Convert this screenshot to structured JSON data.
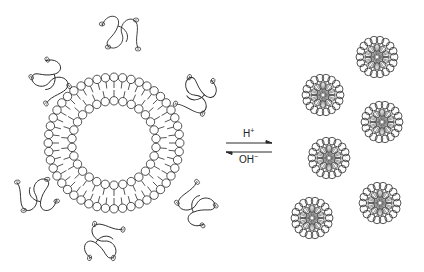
{
  "diagram": {
    "type": "vesicle-to-micelle transition",
    "left": {
      "label": "vesicle (lipid bilayer) with surrounding polymer chains",
      "vesicle": {
        "cx": 114,
        "cy": 143,
        "outer_r": 70,
        "inner_r": 38,
        "outer_heads": 48,
        "inner_heads": 30
      },
      "polymers": [
        {
          "x": 120,
          "y": 30
        },
        {
          "x": 52,
          "y": 78
        },
        {
          "x": 200,
          "y": 95
        },
        {
          "x": 38,
          "y": 198
        },
        {
          "x": 195,
          "y": 208
        },
        {
          "x": 100,
          "y": 242
        }
      ],
      "charge_symbol": "⊖"
    },
    "equilibrium": {
      "forward_label": "H",
      "forward_sup": "+",
      "reverse_label": "OH",
      "reverse_sup": "−"
    },
    "right": {
      "label": "micelles",
      "micelles": [
        {
          "cx": 377,
          "cy": 57,
          "r": 21
        },
        {
          "cx": 323,
          "cy": 95,
          "r": 21
        },
        {
          "cx": 382,
          "cy": 122,
          "r": 21
        },
        {
          "cx": 329,
          "cy": 158,
          "r": 21
        },
        {
          "cx": 380,
          "cy": 203,
          "r": 21
        },
        {
          "cx": 312,
          "cy": 218,
          "r": 21
        }
      ],
      "heads_per_micelle": 18
    },
    "colors": {
      "line": "#2a2a2a",
      "background": "#ffffff"
    }
  }
}
